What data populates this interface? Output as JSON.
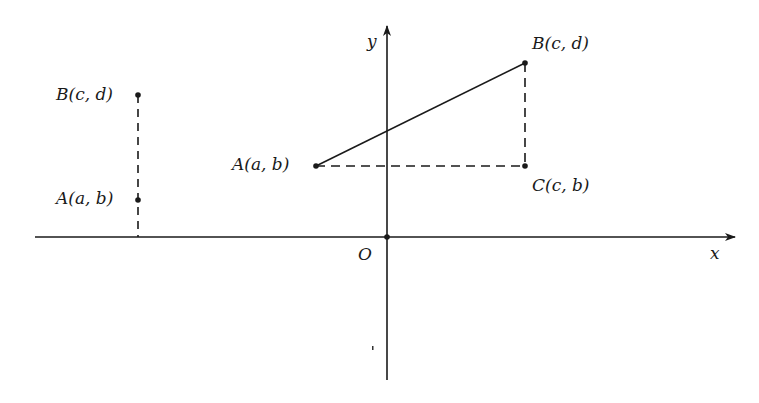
{
  "diagram": {
    "axes": {
      "x_label": "x",
      "y_label": "y",
      "origin_label": "O"
    },
    "left_figure": {
      "point_B_label": "B(c, d)",
      "point_A_label": "A(a, b)"
    },
    "right_figure": {
      "point_A_label": "A(a, b)",
      "point_B_label": "B(c, d)",
      "point_C_label": "C(c, b)"
    },
    "colors": {
      "ink": "#1a1a1a",
      "background": "#ffffff"
    }
  }
}
